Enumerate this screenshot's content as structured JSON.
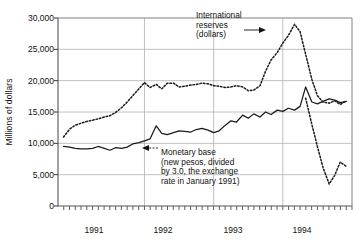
{
  "chart_data": {
    "type": "line",
    "title": "",
    "subtitle": "",
    "xlabel": "",
    "ylabel": "Millions of dollars",
    "ylim": [
      0,
      30000
    ],
    "ytick_labels": [
      "0",
      "5,000",
      "10,000",
      "15,000",
      "20,000",
      "25,000",
      "30,000"
    ],
    "ytick_values": [
      0,
      5000,
      10000,
      15000,
      20000,
      25000,
      30000
    ],
    "xlim": [
      1990.75,
      1995.0
    ],
    "xtick_labels": [
      "1991",
      "1992",
      "1993",
      "1994"
    ],
    "xtick_values": [
      1991.5,
      1992.5,
      1993.5,
      1994.5
    ],
    "x_minor_tick_interval_months": 1,
    "grid": "horizontal-and-year-verticals",
    "legend_position": "none-inline-annotations",
    "annotations": [
      {
        "name": "international-reserves",
        "text": "International\nreserves\n(dollars)",
        "arrow": "right"
      },
      {
        "name": "monetary-base",
        "text": "Monetary base\n(new pesos, divided\nby 3.0, the exchange\nrate in January 1991)",
        "arrow": "left"
      }
    ],
    "series": [
      {
        "name": "International reserves (dollars)",
        "style": "dotted",
        "color": "#1a1a1a",
        "x": [
          1990.83,
          1990.92,
          1991.0,
          1991.08,
          1991.17,
          1991.25,
          1991.33,
          1991.42,
          1991.5,
          1991.58,
          1991.67,
          1991.75,
          1991.83,
          1991.92,
          1992.0,
          1992.08,
          1992.17,
          1992.25,
          1992.33,
          1992.42,
          1992.5,
          1992.58,
          1992.67,
          1992.75,
          1992.83,
          1992.92,
          1993.0,
          1993.08,
          1993.17,
          1993.25,
          1993.33,
          1993.42,
          1993.5,
          1993.58,
          1993.67,
          1993.75,
          1993.83,
          1993.92,
          1994.0,
          1994.08,
          1994.17,
          1994.25,
          1994.33,
          1994.42,
          1994.5,
          1994.58,
          1994.67,
          1994.75,
          1994.83,
          1994.92
        ],
        "values": [
          11000,
          12300,
          12900,
          13200,
          13500,
          13700,
          13900,
          14200,
          14400,
          14900,
          15700,
          16600,
          17600,
          18700,
          19700,
          18900,
          19400,
          18700,
          19600,
          19600,
          19000,
          19100,
          19300,
          19400,
          19600,
          19500,
          19200,
          19100,
          18900,
          19000,
          19200,
          19000,
          18400,
          18500,
          19200,
          21500,
          23300,
          24500,
          26000,
          27200,
          29000,
          27800,
          24200,
          20200,
          17600,
          16600,
          16400,
          16800,
          16200,
          16800
        ]
      },
      {
        "name": "Monetary base (new pesos, divided by 3.0, the exchange rate in January 1991)",
        "style": "solid",
        "color": "#1a1a1a",
        "x": [
          1990.83,
          1990.92,
          1991.0,
          1991.08,
          1991.17,
          1991.25,
          1991.33,
          1991.42,
          1991.5,
          1991.58,
          1991.67,
          1991.75,
          1991.83,
          1991.92,
          1992.0,
          1992.08,
          1992.17,
          1992.25,
          1992.33,
          1992.42,
          1992.5,
          1992.58,
          1992.67,
          1992.75,
          1992.83,
          1992.92,
          1993.0,
          1993.08,
          1993.17,
          1993.25,
          1993.33,
          1993.42,
          1993.5,
          1993.58,
          1993.67,
          1993.75,
          1993.83,
          1993.92,
          1994.0,
          1994.08,
          1994.17,
          1994.25,
          1994.33,
          1994.42,
          1994.5,
          1994.58,
          1994.67,
          1994.75,
          1994.83,
          1994.92
        ],
        "values": [
          9500,
          9400,
          9200,
          9100,
          9100,
          9200,
          9500,
          9200,
          8900,
          9300,
          9200,
          9400,
          9900,
          10100,
          10400,
          10700,
          12800,
          11600,
          11400,
          11700,
          12000,
          11900,
          11800,
          12200,
          12400,
          12100,
          11700,
          12000,
          12900,
          13600,
          13400,
          14500,
          14000,
          14700,
          14200,
          15000,
          14600,
          15300,
          15100,
          15600,
          15300,
          15900,
          19000,
          16600,
          16300,
          16700,
          17100,
          16900,
          16500,
          16700
        ]
      },
      {
        "name": "International reserves (dollars) — late 1994 crash continuation",
        "style": "dotted",
        "color": "#1a1a1a",
        "x": [
          1994.33,
          1994.42,
          1994.5,
          1994.58,
          1994.67,
          1994.75,
          1994.83,
          1994.92
        ],
        "values": [
          17200,
          13000,
          9500,
          6200,
          3500,
          4900,
          7000,
          6300
        ],
        "note": "steep decline branch drawn at right edge"
      }
    ]
  }
}
